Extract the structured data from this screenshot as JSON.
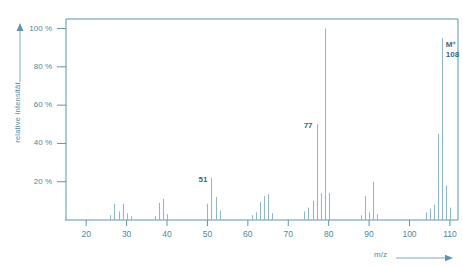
{
  "chart_data": {
    "type": "bar",
    "title": "",
    "subtitle": "",
    "xlabel": "m/z",
    "ylabel": "relative Intensität",
    "xlim": [
      15,
      112
    ],
    "ylim": [
      0,
      105
    ],
    "grid": false,
    "legend": null,
    "x_ticks": [
      20,
      30,
      40,
      50,
      60,
      70,
      80,
      90,
      100,
      110
    ],
    "x_tick_labels": [
      "20",
      "30",
      "40",
      "50",
      "60",
      "70",
      "80",
      "90",
      "100",
      "110"
    ],
    "y_ticks": [
      20,
      40,
      60,
      80,
      100
    ],
    "y_tick_labels": [
      "20 %",
      "40 %",
      "60 %",
      "80 %",
      "100 %"
    ],
    "axis_color": "#5b97aa",
    "peak_color": "#8fb9c7",
    "label_color": "#2f6f84",
    "x": [
      26,
      27,
      28,
      29,
      30,
      31,
      37,
      38,
      39,
      40,
      50,
      51,
      52,
      53,
      61,
      62,
      63,
      64,
      65,
      66,
      74,
      75,
      76,
      77,
      78,
      79,
      80,
      88,
      89,
      90,
      91,
      92,
      104,
      105,
      106,
      107,
      108,
      109,
      110
    ],
    "values": [
      2.5,
      8.5,
      4.5,
      8.5,
      3.5,
      2.0,
      2.0,
      9.0,
      11.0,
      3.0,
      8.5,
      22.0,
      12.0,
      5.0,
      2.5,
      4.0,
      9.5,
      12.5,
      13.5,
      3.5,
      4.5,
      6.5,
      10.0,
      50.0,
      14.0,
      100.0,
      14.0,
      2.5,
      12.5,
      4.0,
      20.0,
      3.0,
      4.0,
      6.0,
      8.0,
      45.0,
      95.0,
      18.0,
      6.5
    ],
    "annotations": [
      {
        "mz": 51,
        "text": "51",
        "value": 22.0
      },
      {
        "mz": 77,
        "text": "77",
        "value": 50.0
      },
      {
        "mz": 108,
        "text": "M⁺",
        "text2": "108",
        "value": 95.0
      }
    ]
  },
  "axis": {
    "y_label": "relative Intensität",
    "x_label": "m/z",
    "y_ticks": [
      "100 %",
      "80 %",
      "60 %",
      "40 %",
      "20 %"
    ],
    "x_ticks": [
      "20",
      "30",
      "40",
      "50",
      "60",
      "70",
      "80",
      "90",
      "100",
      "110"
    ]
  },
  "labels": {
    "peak_51": "51",
    "peak_77": "77",
    "peak_m_plus": "M⁺",
    "peak_108": "108"
  },
  "colors": {
    "axis": "#5b97aa",
    "peak": "#8fb9c7",
    "text": "#4e8a9c",
    "label": "#2f6f84"
  }
}
